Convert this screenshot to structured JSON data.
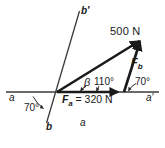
{
  "figure": {
    "caption": "a",
    "type": "force-vector-parallelogram-diagram",
    "labels": {
      "resultant_magnitude": "500 N",
      "force_b": "F",
      "force_b_sub": "b",
      "force_a_equation_symbol": "F",
      "force_a_sub": "a",
      "force_a_equation_rest": " = 320 N",
      "angle_beta": "β",
      "angle_110": "110°",
      "angle_70_right": "70°",
      "angle_70_left": "70°",
      "axis_a_left": "a",
      "axis_a_right": "a′",
      "axis_b_top": "b′",
      "axis_b_bottom": "b"
    },
    "colors": {
      "ink": "#1a1a1a",
      "thin_line": "#3a3a3a",
      "background": "#ffffff"
    },
    "geometry": {
      "origin": [
        57,
        92
      ],
      "apex": [
        141,
        40
      ],
      "base_right": [
        124,
        92
      ],
      "axis_a_start": [
        6,
        92
      ],
      "axis_a_end": [
        159,
        92
      ],
      "axis_b_top": [
        79,
        11
      ],
      "axis_b_bottom": [
        46,
        123
      ]
    }
  }
}
